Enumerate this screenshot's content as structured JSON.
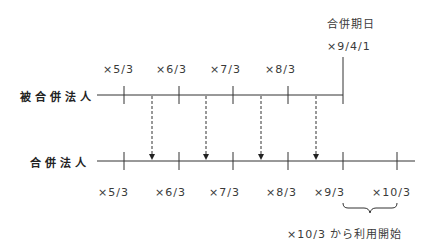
{
  "diagram": {
    "merger_date_label": "合併期日",
    "merger_date_value": "×9/4/1",
    "rows": {
      "merged_corp": "被合併法人",
      "merging_corp": "合併法人"
    },
    "top_dates": [
      "×5/3",
      "×6/3",
      "×7/3",
      "×8/3"
    ],
    "bottom_dates": [
      "×5/3",
      "×6/3",
      "×7/3",
      "×8/3",
      "×9/3",
      "×10/3"
    ],
    "brace_note": "×10/3 から利用開始",
    "line_color": "#333333"
  }
}
